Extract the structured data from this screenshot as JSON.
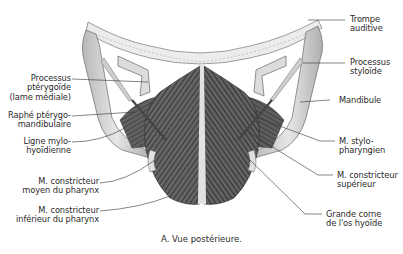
{
  "figure": {
    "caption": "A. Vue postérieure.",
    "view": "posterior",
    "colors": {
      "background": "#ffffff",
      "muscle_dark": "#3c3c3c",
      "muscle_mid": "#6a6a6a",
      "bone": "#d8d8d8",
      "bone_shade": "#a8a8a8",
      "raphe": "#e4e4e4",
      "leader_line": "#333333",
      "text": "#2a2a2a"
    }
  },
  "labels": {
    "left": [
      {
        "id": "processus-pterygoide",
        "text": "Processus\nptérygoïde\n(lame médiale)"
      },
      {
        "id": "raphe-pterygo-mandibulaire",
        "text": "Raphé ptérygo-\nmandibulaire"
      },
      {
        "id": "ligne-mylo-hyoidienne",
        "text": "Ligne mylo-\nhyoïdienne"
      },
      {
        "id": "constricteur-moyen",
        "text": "M. constricteur\nmoyen du pharynx"
      },
      {
        "id": "constricteur-inferieur",
        "text": "M. constricteur\ninférieur du pharynx"
      }
    ],
    "right": [
      {
        "id": "trompe-auditive",
        "text": "Trompe\nauditive"
      },
      {
        "id": "processus-styloide",
        "text": "Processus\nstyloïde"
      },
      {
        "id": "mandibule",
        "text": "Mandibule"
      },
      {
        "id": "stylo-pharyngien",
        "text": "M. stylo-\npharyngien"
      },
      {
        "id": "constricteur-superieur",
        "text": "M. constricteur\nsupérieur"
      },
      {
        "id": "grande-corne-hyoide",
        "text": "Grande corne\nde l'os hyoïde"
      }
    ]
  }
}
